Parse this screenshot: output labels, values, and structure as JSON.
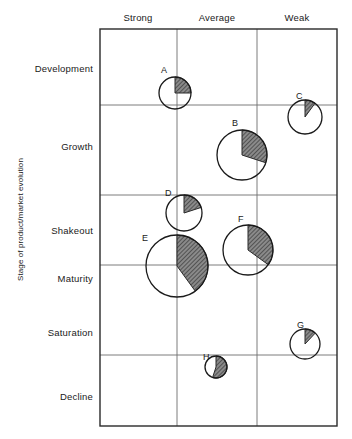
{
  "chart_data": {
    "type": "scatter",
    "title": "",
    "xlabel": "",
    "ylabel": "Stage of product/market evolution",
    "caption": "",
    "x_categories": [
      "Strong",
      "Average",
      "Weak"
    ],
    "y_categories": [
      "Development",
      "Growth",
      "Shakeout",
      "Maturity",
      "Saturation",
      "Decline"
    ],
    "grid": true,
    "legend": "none",
    "note": "Bubble (pie) chart: circle area = business size, shaded wedge = market share held",
    "series": [
      {
        "name": "A",
        "x_position": "Strong/Average boundary",
        "y_position": "Development",
        "cx": 175,
        "cy": 93,
        "r": 16,
        "share_pct": 25,
        "label_x": 161,
        "label_y": 65
      },
      {
        "name": "B",
        "x_position": "Average",
        "y_position": "Growth",
        "cx": 242,
        "cy": 155,
        "r": 25,
        "share_pct": 30,
        "label_x": 232,
        "label_y": 118
      },
      {
        "name": "C",
        "x_position": "Weak",
        "y_position": "Growth (upper)",
        "cx": 305,
        "cy": 117,
        "r": 17,
        "share_pct": 10,
        "label_x": 296,
        "label_y": 91
      },
      {
        "name": "D",
        "x_position": "Average (left edge)",
        "y_position": "Shakeout",
        "cx": 184,
        "cy": 213,
        "r": 18,
        "share_pct": 20,
        "label_x": 165,
        "label_y": 188
      },
      {
        "name": "E",
        "x_position": "Strong/Average boundary",
        "y_position": "Maturity",
        "cx": 177,
        "cy": 266,
        "r": 31,
        "share_pct": 40,
        "label_x": 142,
        "label_y": 233
      },
      {
        "name": "F",
        "x_position": "Average",
        "y_position": "Shakeout/Maturity",
        "cx": 248,
        "cy": 250,
        "r": 25,
        "share_pct": 35,
        "label_x": 238,
        "label_y": 214
      },
      {
        "name": "G",
        "x_position": "Weak",
        "y_position": "Saturation",
        "cx": 305,
        "cy": 344,
        "r": 15,
        "share_pct": 12,
        "label_x": 297,
        "label_y": 320
      },
      {
        "name": "H",
        "x_position": "Average",
        "y_position": "Saturation/Decline",
        "cx": 216,
        "cy": 367,
        "r": 11,
        "share_pct": 55,
        "label_x": 203,
        "label_y": 352
      }
    ],
    "frame": {
      "left": 100,
      "right": 337,
      "top": 29,
      "bottom": 426,
      "vertical_gridlines": [
        177,
        257
      ],
      "horizontal_gridlines": [
        105,
        195,
        265,
        355
      ]
    },
    "column_header_positions": [
      138,
      217,
      297
    ],
    "row_label_positions": [
      68,
      146,
      230,
      278,
      332,
      396
    ]
  }
}
